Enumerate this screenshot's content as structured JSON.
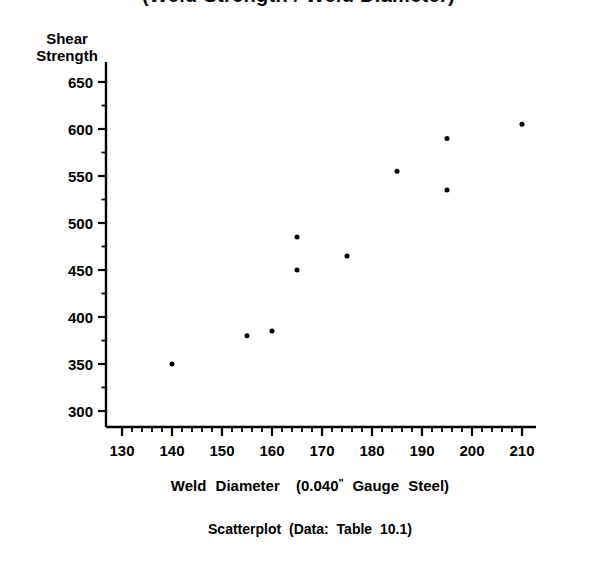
{
  "figure": {
    "title_clipped": "(Weld Strength / Weld Diameter)",
    "caption": {
      "text_a": "Scatterplot",
      "text_b": "(Data:",
      "text_c": "Table",
      "text_d": "10.1)"
    }
  },
  "chart_data": {
    "type": "scatter",
    "title": "",
    "xlabel_parts": {
      "a": "Weld",
      "b": "Diameter",
      "c": "(0.040",
      "inch_mark": "\"",
      "d": "Gauge",
      "e": "Steel)"
    },
    "xlabel": "Weld Diameter (0.040\" Gauge Steel)",
    "ylabel_lines": [
      "Shear",
      "Strength"
    ],
    "ylabel": "Shear Strength",
    "xlim": [
      127,
      213
    ],
    "ylim": [
      293,
      655
    ],
    "x_major_ticks": [
      130,
      140,
      150,
      160,
      170,
      180,
      190,
      200,
      210
    ],
    "x_tick_labels": [
      "130",
      "140",
      "150",
      "160",
      "170",
      "180",
      "190",
      "200",
      "210"
    ],
    "x_minor_step": 2,
    "y_major_ticks": [
      300,
      350,
      400,
      450,
      500,
      550,
      600,
      650
    ],
    "y_tick_labels": [
      "300",
      "350",
      "400",
      "450",
      "500",
      "550",
      "600",
      "650"
    ],
    "y_minor_step": 25,
    "grid": false,
    "legend": null,
    "marker": {
      "shape": "circle",
      "color": "#000000",
      "size_px": 5
    },
    "points": [
      {
        "x": 140,
        "y": 350
      },
      {
        "x": 155,
        "y": 380
      },
      {
        "x": 160,
        "y": 385
      },
      {
        "x": 165,
        "y": 485
      },
      {
        "x": 165,
        "y": 450
      },
      {
        "x": 175,
        "y": 465
      },
      {
        "x": 185,
        "y": 555
      },
      {
        "x": 195,
        "y": 590
      },
      {
        "x": 195,
        "y": 535
      },
      {
        "x": 210,
        "y": 605
      }
    ]
  }
}
